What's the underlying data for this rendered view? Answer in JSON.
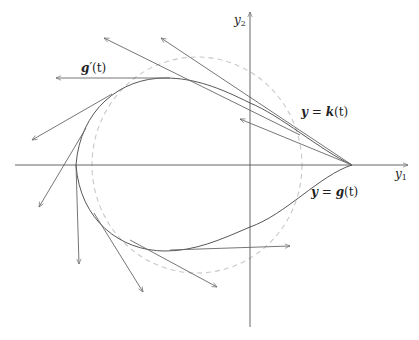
{
  "figure": {
    "width": 419,
    "height": 340,
    "colors": {
      "axis": "#555555",
      "curve": "#444444",
      "vectors": "#666666",
      "dashed_circle": "#c8c8c8",
      "background": "#ffffff"
    },
    "axes": {
      "x_label": "y",
      "x_label_sub": "1",
      "y_label": "y",
      "y_label_sub": "2",
      "origin": [
        250,
        165
      ],
      "x_range_px": [
        15,
        408
      ],
      "y_range_px": [
        12,
        327
      ]
    },
    "labels": {
      "tangent": "g′(t)",
      "tangent_bold_part": "g",
      "tangent_rest": "′(t)",
      "upper_curve": "y = k(t)",
      "upper_curve_y": "y",
      "upper_curve_eq": " = ",
      "upper_curve_fn": "k",
      "upper_curve_arg": "(t)",
      "lower_curve": "y = g(t)",
      "lower_curve_y": "y",
      "lower_curve_eq": " = ",
      "lower_curve_fn": "g",
      "lower_curve_arg": "(t)"
    },
    "dashed_circle": {
      "cx": 197,
      "cy": 165,
      "rx": 105,
      "ry": 108
    },
    "cusp": [
      352,
      165
    ],
    "tangent_vectors": [
      {
        "from": [
          352,
          165
        ],
        "to": [
          161,
          38
        ]
      },
      {
        "from": [
          300,
          135
        ],
        "to": [
          104,
          38
        ]
      },
      {
        "from": [
          170,
          78
        ],
        "to": [
          56,
          78
        ]
      },
      {
        "from": [
          112,
          94
        ],
        "to": [
          32,
          140
        ]
      },
      {
        "from": [
          352,
          165
        ],
        "to": [
          240,
          119
        ]
      },
      {
        "from": [
          86,
          128
        ],
        "to": [
          39,
          207
        ]
      },
      {
        "from": [
          76,
          165
        ],
        "to": [
          79,
          264
        ]
      },
      {
        "from": [
          94,
          213
        ],
        "to": [
          143,
          292
        ]
      },
      {
        "from": [
          130,
          240
        ],
        "to": [
          217,
          287
        ]
      },
      {
        "from": [
          170,
          250
        ],
        "to": [
          290,
          246
        ]
      }
    ]
  }
}
